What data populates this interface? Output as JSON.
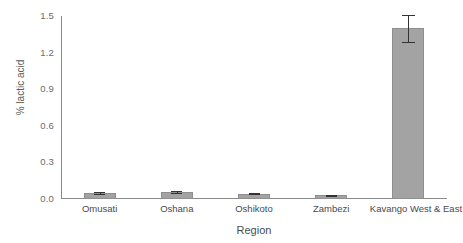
{
  "chart_data": {
    "type": "bar",
    "title": "",
    "xlabel": "Region",
    "ylabel": "% lactic acid",
    "categories": [
      "Omusati",
      "Oshana",
      "Oshikoto",
      "Zambezi",
      "Kavango West & East"
    ],
    "values": [
      0.05,
      0.055,
      0.045,
      0.03,
      1.4
    ],
    "errors": [
      0.008,
      0.008,
      0.007,
      0.006,
      0.11
    ],
    "ylim": [
      0.0,
      1.5
    ],
    "yticks": [
      "0.0",
      "0.3",
      "0.6",
      "0.9",
      "1.2",
      "1.5"
    ],
    "ytick_values": [
      0.0,
      0.3,
      0.6,
      0.9,
      1.2,
      1.5
    ],
    "grid": false,
    "legend": "none",
    "bar_color": "#a3a3a3",
    "bar_edge_color": "#8f8f8f",
    "error_color": "#333333",
    "axis_color": "#8a8a8a"
  }
}
